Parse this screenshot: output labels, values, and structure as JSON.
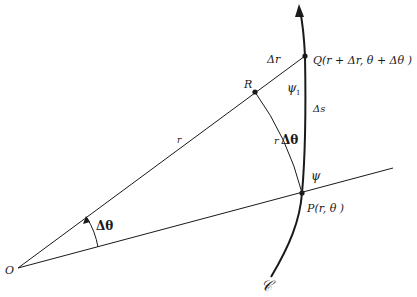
{
  "diagram": {
    "type": "polar-curve-arc-length",
    "colors": {
      "ink": "#1a1a1a",
      "background": "#ffffff"
    },
    "points": {
      "O": {
        "label": "O",
        "x": 18,
        "y": 268
      },
      "P": {
        "label": "P(r, θ )",
        "x": 302,
        "y": 193
      },
      "R": {
        "label": "R",
        "x": 255,
        "y": 92
      },
      "Q": {
        "label": "Q(r + Δr, θ + Δθ )",
        "x": 305,
        "y": 56
      }
    },
    "labels": {
      "O": "O",
      "P": "P(r, θ )",
      "R": "R",
      "Q": "Q(r + Δr, θ + Δθ )",
      "r": "r",
      "delta_r": "Δr",
      "r_delta_theta": "rΔθ",
      "r_delta_theta_r": "r",
      "r_delta_theta_dt": "Δθ",
      "delta_s": "Δs",
      "psi": "ψ",
      "psi1": "ψ",
      "psi1_sub": "1",
      "delta_theta": "Δθ",
      "curve": "𝒞"
    },
    "segments": [
      {
        "name": "ray-OP",
        "from": "O",
        "through": "P"
      },
      {
        "name": "ray-OQ",
        "from": "O",
        "to": "Q"
      },
      {
        "name": "arc-RP",
        "label": "rΔθ"
      },
      {
        "name": "curve-C",
        "label": "𝒞",
        "direction": "upward-arrow"
      }
    ]
  }
}
